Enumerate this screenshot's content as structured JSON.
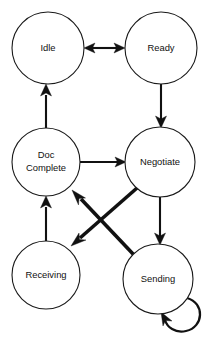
{
  "diagram": {
    "type": "state-transition-diagram",
    "title": "",
    "background_color": "#ffffff",
    "line_color": "#111111",
    "node_fill_color": "#ffffff",
    "nodes": [
      {
        "id": "idle",
        "label": "Idle",
        "label_lines": [
          "Idle"
        ],
        "cx": 48,
        "cy": 48,
        "r": 36
      },
      {
        "id": "ready",
        "label": "Ready",
        "label_lines": [
          "Ready"
        ],
        "cx": 161,
        "cy": 48,
        "r": 36
      },
      {
        "id": "doc_complete",
        "label": "Doc Complete",
        "label_lines": [
          "Doc",
          "Complete"
        ],
        "cx": 46,
        "cy": 162,
        "r": 34
      },
      {
        "id": "negotiate",
        "label": "Negotiate",
        "label_lines": [
          "Negotiate"
        ],
        "cx": 160,
        "cy": 162,
        "r": 35
      },
      {
        "id": "receiving",
        "label": "Receiving",
        "label_lines": [
          "Receiving"
        ],
        "cx": 46,
        "cy": 275,
        "r": 34
      },
      {
        "id": "sending",
        "label": "Sending",
        "label_lines": [
          "Sending"
        ],
        "cx": 158,
        "cy": 279,
        "r": 35
      }
    ],
    "edges": [
      {
        "id": "idle-ready",
        "from": "idle",
        "to": "ready",
        "kind": "bidirectional",
        "weight": "thin"
      },
      {
        "id": "ready-negotiate",
        "from": "ready",
        "to": "negotiate",
        "kind": "directed",
        "weight": "thin"
      },
      {
        "id": "doccomplete-idle",
        "from": "doc_complete",
        "to": "idle",
        "kind": "directed",
        "weight": "thin"
      },
      {
        "id": "doccomplete-negotiate",
        "from": "doc_complete",
        "to": "negotiate",
        "kind": "directed",
        "weight": "thin"
      },
      {
        "id": "receiving-doccomplete",
        "from": "receiving",
        "to": "doc_complete",
        "kind": "directed",
        "weight": "thin"
      },
      {
        "id": "negotiate-sending",
        "from": "negotiate",
        "to": "sending",
        "kind": "directed",
        "weight": "thin"
      },
      {
        "id": "negotiate-receiving",
        "from": "negotiate",
        "to": "receiving",
        "kind": "directed",
        "weight": "thick"
      },
      {
        "id": "sending-doccomplete",
        "from": "sending",
        "to": "doc_complete",
        "kind": "directed",
        "weight": "thick"
      },
      {
        "id": "sending-sending",
        "from": "sending",
        "to": "sending",
        "kind": "self-loop",
        "weight": "thin"
      }
    ]
  }
}
